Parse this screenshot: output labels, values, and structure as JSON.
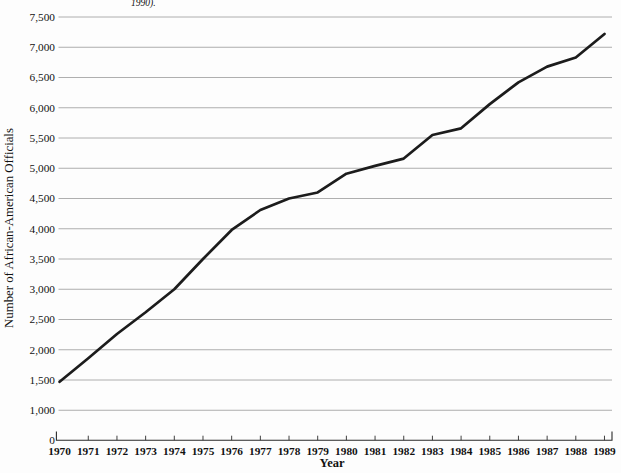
{
  "caption_fragment": "1990).",
  "chart_data": {
    "type": "line",
    "title": "",
    "xlabel": "Year",
    "ylabel": "Number of African-American Officials",
    "categories": [
      "1970",
      "1971",
      "1972",
      "1973",
      "1974",
      "1975",
      "1976",
      "1977",
      "1978",
      "1979",
      "1980",
      "1981",
      "1982",
      "1983",
      "1984",
      "1985",
      "1986",
      "1987",
      "1988",
      "1989"
    ],
    "series": [
      {
        "name": "Number of African-American Officials",
        "values": [
          1470,
          1860,
          2260,
          2620,
          3000,
          3500,
          3980,
          4310,
          4500,
          4600,
          4910,
          5040,
          5160,
          5550,
          5660,
          6060,
          6420,
          6680,
          6830,
          7220
        ]
      }
    ],
    "yticks": [
      0,
      1000,
      1500,
      2000,
      2500,
      3000,
      3500,
      4000,
      4500,
      5000,
      5500,
      6000,
      6500,
      7000,
      7500
    ],
    "axis_note": "y-axis compressed: gap from 0 to 1,000 occupies one 500-unit step",
    "grid": true,
    "legend": "none",
    "colors": {
      "line": "#1c1c1c",
      "grid": "#9a9a9a",
      "axis": "#2a2a2a",
      "text": "#111111"
    }
  }
}
